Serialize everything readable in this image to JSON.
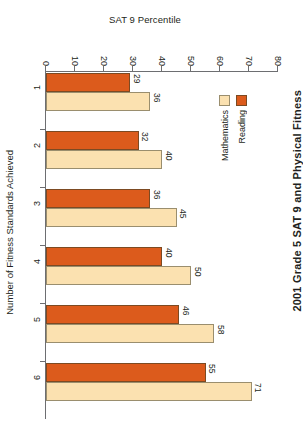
{
  "chart_data": {
    "type": "bar",
    "orientation": "horizontal",
    "title": "2001 Grade 5 SAT 9 and Physical Fitness",
    "xlabel": "SAT 9 Percentile",
    "ylabel": "Number of Fitness Standards Achieved",
    "categories": [
      "1",
      "2",
      "3",
      "4",
      "5",
      "6"
    ],
    "series": [
      {
        "name": "Reading",
        "color": "#DC5B1C",
        "values": [
          29,
          32,
          36,
          40,
          46,
          55
        ]
      },
      {
        "name": "Mathematics",
        "color": "#FBE1B0",
        "values": [
          36,
          40,
          45,
          50,
          58,
          71
        ]
      }
    ],
    "xlim": [
      0,
      80
    ],
    "xticks": [
      0,
      10,
      20,
      30,
      40,
      50,
      60,
      70,
      80
    ],
    "xtick_labels": [
      "0",
      "10",
      "20",
      "30",
      "40",
      "50",
      "60",
      "70",
      "80"
    ],
    "grid": false,
    "legend_position": "right",
    "value_labels_shown": true
  },
  "axis": {
    "value_title": "SAT 9 Percentile",
    "category_title": "Number of Fitness Standards Achieved"
  },
  "legend": {
    "entries": [
      {
        "label": "Reading",
        "color": "#DC5B1C"
      },
      {
        "label": "Mathematics",
        "color": "#FBE1B0"
      }
    ]
  },
  "title": "2001 Grade 5 SAT 9 and Physical Fitness"
}
